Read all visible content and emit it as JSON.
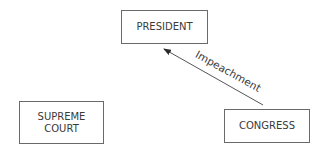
{
  "diagram": {
    "nodes": [
      {
        "id": "president",
        "label": "PRESIDENT"
      },
      {
        "id": "supreme_court",
        "label_line1": "SUPREME",
        "label_line2": "COURT"
      },
      {
        "id": "congress",
        "label": "CONGRESS"
      }
    ],
    "edges": [
      {
        "from": "congress",
        "to": "president",
        "label": "Impeachment"
      }
    ]
  }
}
